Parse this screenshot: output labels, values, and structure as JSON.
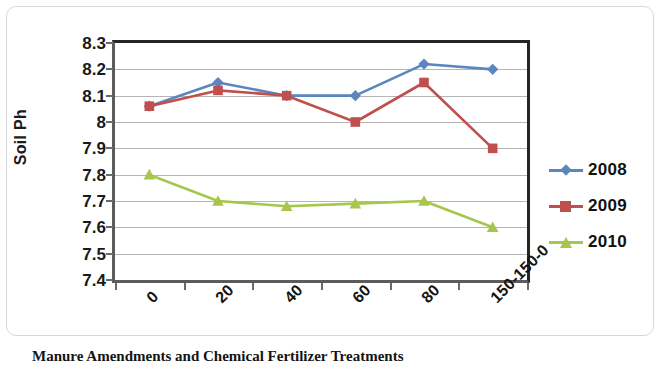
{
  "chart_data": {
    "type": "line",
    "title": "",
    "xlabel": "Manure Amendments and Chemical Fertilizer Treatments",
    "ylabel": "Soil Ph",
    "categories": [
      "0",
      "20",
      "40",
      "60",
      "80",
      "150-150-0"
    ],
    "ylim": [
      7.4,
      8.3
    ],
    "yticks": [
      "7.4",
      "7.5",
      "7.6",
      "7.7",
      "7.8",
      "7.9",
      "8",
      "8.1",
      "8.2",
      "8.3"
    ],
    "ytick_values": [
      7.4,
      7.5,
      7.6,
      7.7,
      7.8,
      7.9,
      8.0,
      8.1,
      8.2,
      8.3
    ],
    "grid": true,
    "legend_position": "right",
    "series": [
      {
        "name": "2008",
        "color": "#5B86BE",
        "marker": "diamond",
        "values": [
          8.06,
          8.15,
          8.1,
          8.1,
          8.22,
          8.2
        ]
      },
      {
        "name": "2009",
        "color": "#C0504D",
        "marker": "square",
        "values": [
          8.06,
          8.12,
          8.1,
          8.0,
          8.15,
          7.9
        ]
      },
      {
        "name": "2010",
        "color": "#A7C64C",
        "marker": "triangle",
        "values": [
          7.8,
          7.7,
          7.68,
          7.69,
          7.7,
          7.6
        ]
      }
    ]
  },
  "axis": {
    "y_title": "Soil Ph"
  },
  "caption": {
    "text": "Manure Amendments and Chemical Fertilizer Treatments"
  },
  "legend": {
    "entries": [
      {
        "label": "2008"
      },
      {
        "label": "2009"
      },
      {
        "label": "2010"
      }
    ]
  }
}
